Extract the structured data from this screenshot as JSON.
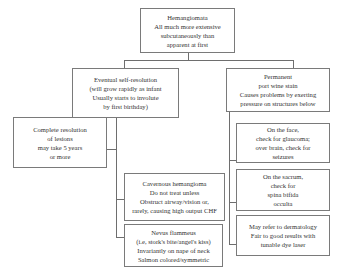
{
  "diagram": {
    "root": {
      "lines": [
        "Hemangiomata",
        "All much more extensive",
        "subcutaneously than",
        "apparent at first"
      ]
    },
    "left_branch": {
      "lines": [
        "Eventual self-resolution",
        "(will grow rapidly as infant",
        "Usually starts to involute",
        "by first birthday)"
      ],
      "children": [
        {
          "lines": [
            "Complete resolution",
            "of lesions",
            "may take 5 years",
            "or more"
          ]
        },
        {
          "lines": [
            "Cavernous hemangioma",
            "Do not treat unless",
            "Obstruct airway/vision or,",
            "rarely, causing high output CHF"
          ]
        },
        {
          "lines": [
            "Nevus flammeus",
            "(i.e, stork's bite/angel's kiss)",
            "Invariantly on nape of neck",
            "Salmon colored/symmetric"
          ]
        }
      ]
    },
    "right_branch": {
      "lines": [
        "Permanent",
        "port wine stain",
        "Causes problems by exerting",
        "pressure on structures below"
      ],
      "children": [
        {
          "lines": [
            "On the face,",
            "check for glaucoma;",
            "over brain, check for",
            "seizures"
          ]
        },
        {
          "lines": [
            "On the sacrum,",
            "check for",
            "spina bifida",
            "occulta"
          ]
        },
        {
          "lines": [
            "May refer to dermatology",
            "Fair to good results with",
            "tunable dye laser"
          ]
        }
      ]
    }
  }
}
